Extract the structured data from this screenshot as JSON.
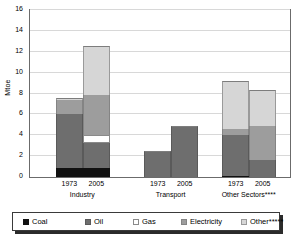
{
  "chart_data": {
    "type": "bar",
    "subtype": "stacked-grouped",
    "title": "",
    "xlabel": "",
    "ylabel": "Mtoe",
    "ylim": [
      0,
      16
    ],
    "ytick_step": 2,
    "yticks": [
      "16",
      "14",
      "12",
      "10",
      "8",
      "6",
      "4",
      "2",
      "0"
    ],
    "grid": true,
    "legend_position": "bottom",
    "series": [
      {
        "name": "Coal",
        "color": "#111111"
      },
      {
        "name": "Oil",
        "color": "#6e6e6e"
      },
      {
        "name": "Gas",
        "color": "#ffffff"
      },
      {
        "name": "Electricity",
        "color": "#9d9d9d"
      },
      {
        "name": "Other*****",
        "color": "#d6d6d6"
      }
    ],
    "groups": [
      {
        "label": "Industry",
        "bars": [
          {
            "year": "1973",
            "values": {
              "Coal": 0.9,
              "Oil": 5.1,
              "Gas": 0.0,
              "Electricity": 1.35,
              "Other*****": 0.25
            },
            "total": 7.6
          },
          {
            "year": "2005",
            "values": {
              "Coal": 0.9,
              "Oil": 2.4,
              "Gas": 0.7,
              "Electricity": 3.9,
              "Other*****": 4.7
            },
            "total": 12.6
          }
        ]
      },
      {
        "label": "Transport",
        "bars": [
          {
            "year": "1973",
            "values": {
              "Coal": 0.0,
              "Oil": 2.5,
              "Gas": 0.0,
              "Electricity": 0.0,
              "Other*****": 0.0
            },
            "total": 2.5
          },
          {
            "year": "2005",
            "values": {
              "Coal": 0.0,
              "Oil": 4.85,
              "Gas": 0.0,
              "Electricity": 0.0,
              "Other*****": 0.0
            },
            "total": 4.85
          }
        ]
      },
      {
        "label": "Other Sectors****",
        "bars": [
          {
            "year": "1973",
            "values": {
              "Coal": 0.12,
              "Oil": 3.88,
              "Gas": 0.0,
              "Electricity": 0.6,
              "Other*****": 4.6
            },
            "total": 9.2
          },
          {
            "year": "2005",
            "values": {
              "Coal": 0.0,
              "Oil": 1.6,
              "Gas": 0.0,
              "Electricity": 3.25,
              "Other*****": 3.45
            },
            "total": 8.3
          }
        ]
      }
    ]
  },
  "axis": {
    "y_title": "Mtoe"
  },
  "legend": {
    "items": [
      {
        "label": "Coal",
        "swatch": "coal"
      },
      {
        "label": "Oil",
        "swatch": "oil"
      },
      {
        "label": "Gas",
        "swatch": "gas"
      },
      {
        "label": "Electricity",
        "swatch": "elec"
      },
      {
        "label": "Other*****",
        "swatch": "other"
      }
    ]
  }
}
